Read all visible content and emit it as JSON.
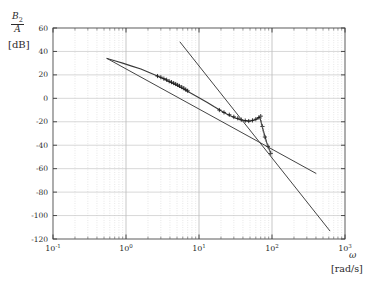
{
  "figure": {
    "ylabel_numerator": "B",
    "ylabel_numerator_sub": "2",
    "ylabel_denominator": "A",
    "ylabel_unit": "[dB]",
    "xlabel_symbol": "ω",
    "xlabel_unit": "[rad/s]"
  },
  "chart_data": {
    "type": "line",
    "title": "",
    "subtitle": "",
    "xlabel": "ω [rad/s]",
    "ylabel": "B2/A [dB]",
    "xscale": "log",
    "yscale": "linear",
    "xlim": [
      0.1,
      1000
    ],
    "ylim": [
      -120,
      60
    ],
    "grid": true,
    "grid_style": "dotted-minor-solid-major",
    "legend": "none",
    "xticks": [
      0.1,
      1,
      10,
      100,
      1000
    ],
    "xtick_labels": [
      "10-1",
      "100",
      "101",
      "102",
      "103"
    ],
    "xtick_mantissa": [
      "10",
      "10",
      "10",
      "10",
      "10"
    ],
    "xtick_exponents": [
      "-1",
      "0",
      "1",
      "2",
      "3"
    ],
    "yticks": [
      60,
      40,
      20,
      0,
      -20,
      -40,
      -60,
      -80,
      -100,
      -120
    ],
    "ytick_labels": [
      "60",
      "40",
      "20",
      "0",
      "-20",
      "-40",
      "-60",
      "-80",
      "-100",
      "-120"
    ],
    "series": [
      {
        "name": "measured-response-curve",
        "style": "solid",
        "marker": "none",
        "color": "#3a3a3a",
        "points": [
          [
            0.55,
            34.0
          ],
          [
            0.7,
            32.0
          ],
          [
            0.9,
            30.0
          ],
          [
            1.2,
            27.5
          ],
          [
            1.6,
            25.0
          ],
          [
            2.0,
            22.5
          ],
          [
            2.6,
            19.5
          ],
          [
            3.2,
            17.0
          ],
          [
            4.0,
            14.0
          ],
          [
            5.0,
            11.0
          ],
          [
            6.3,
            7.5
          ],
          [
            8.0,
            4.0
          ],
          [
            10.0,
            0.5
          ],
          [
            13.0,
            -3.5
          ],
          [
            16.0,
            -7.0
          ],
          [
            20.0,
            -10.5
          ],
          [
            25.0,
            -14.0
          ],
          [
            32.0,
            -17.0
          ],
          [
            40.0,
            -19.0
          ],
          [
            50.0,
            -19.5
          ],
          [
            60.0,
            -18.0
          ],
          [
            68.0,
            -16.0
          ],
          [
            72.0,
            -22.0
          ],
          [
            78.0,
            -30.0
          ],
          [
            85.0,
            -38.0
          ],
          [
            95.0,
            -46.0
          ]
        ]
      },
      {
        "name": "measured-data-markers",
        "style": "none",
        "marker": "plus",
        "color": "#1a1a1a",
        "points": [
          [
            2.7,
            19.0
          ],
          [
            3.0,
            18.0
          ],
          [
            3.3,
            16.8
          ],
          [
            3.6,
            15.8
          ],
          [
            3.9,
            14.6
          ],
          [
            4.2,
            13.8
          ],
          [
            4.5,
            13.0
          ],
          [
            4.8,
            12.2
          ],
          [
            5.1,
            11.4
          ],
          [
            5.4,
            10.6
          ],
          [
            5.8,
            9.6
          ],
          [
            6.2,
            8.6
          ],
          [
            6.6,
            7.4
          ],
          [
            7.0,
            6.4
          ],
          [
            19.0,
            -10.0
          ],
          [
            22.0,
            -12.0
          ],
          [
            26.0,
            -14.0
          ],
          [
            30.0,
            -15.8
          ],
          [
            34.0,
            -17.0
          ],
          [
            38.0,
            -18.2
          ],
          [
            43.0,
            -19.0
          ],
          [
            48.0,
            -19.4
          ],
          [
            54.0,
            -18.8
          ],
          [
            60.0,
            -17.8
          ],
          [
            66.0,
            -16.4
          ],
          [
            70.0,
            -15.2
          ],
          [
            74.0,
            -24.0
          ],
          [
            80.0,
            -33.0
          ],
          [
            88.0,
            -41.0
          ],
          [
            96.0,
            -47.0
          ]
        ]
      },
      {
        "name": "resonance-dashed-drop",
        "style": "dashed",
        "marker": "none",
        "color": "#6a6a6a",
        "points": [
          [
            70.0,
            -15.0
          ],
          [
            72.0,
            -21.0
          ],
          [
            75.0,
            -27.0
          ],
          [
            78.0,
            -32.0
          ],
          [
            82.0,
            -36.0
          ],
          [
            88.0,
            -41.0
          ],
          [
            96.0,
            -47.0
          ]
        ]
      },
      {
        "name": "low-frequency-asymptote",
        "style": "solid-straight",
        "marker": "none",
        "color": "#3a3a3a",
        "points": [
          [
            0.55,
            34.0
          ],
          [
            400.0,
            -64.0
          ]
        ]
      },
      {
        "name": "high-frequency-asymptote",
        "style": "solid-straight",
        "marker": "none",
        "color": "#3a3a3a",
        "points": [
          [
            5.5,
            48.0
          ],
          [
            620.0,
            -113.0
          ]
        ]
      }
    ]
  }
}
